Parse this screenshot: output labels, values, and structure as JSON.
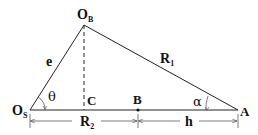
{
  "diagram": {
    "type": "geometry",
    "points": {
      "O_B": {
        "label": "O",
        "sub": "B",
        "x": 84,
        "y": 25
      },
      "O_S": {
        "label": "O",
        "sub": "S",
        "x": 30,
        "y": 110
      },
      "C": {
        "label": "C",
        "x": 84,
        "y": 110
      },
      "B": {
        "label": "B",
        "x": 138,
        "y": 110
      },
      "A": {
        "label": "A",
        "x": 238,
        "y": 110
      }
    },
    "segments": {
      "e": {
        "label": "e",
        "from": "O_S",
        "to": "O_B"
      },
      "R1": {
        "label": "R",
        "sub": "1",
        "from": "O_B",
        "to": "A"
      },
      "base": {
        "from": "O_S",
        "to": "A"
      },
      "height": {
        "from": "O_B",
        "to": "C",
        "style": "dashed"
      }
    },
    "angles": {
      "theta": {
        "label": "θ",
        "at": "O_S"
      },
      "alpha": {
        "label": "α",
        "at": "A"
      }
    },
    "dimensions": {
      "R2": {
        "label": "R",
        "sub": "2",
        "from": "O_S",
        "to": "B"
      },
      "h": {
        "label": "h",
        "from": "B",
        "to": "A"
      }
    }
  }
}
